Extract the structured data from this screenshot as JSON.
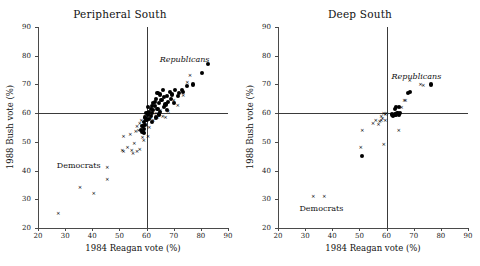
{
  "figure": {
    "background": "#ffffff",
    "marker_color": "#000000",
    "axis_color": "#4a4a4a"
  },
  "chart_data": [
    {
      "type": "scatter",
      "title": "Peripheral South",
      "xlabel": "1984 Reagan vote (%)",
      "ylabel": "1988 Bush vote (%)",
      "xlim": [
        20,
        90
      ],
      "ylim": [
        20,
        90
      ],
      "xticks": [
        20,
        30,
        40,
        50,
        60,
        70,
        80,
        90
      ],
      "yticks": [
        20,
        30,
        40,
        50,
        60,
        70,
        80,
        90
      ],
      "grid": false,
      "reference_lines": {
        "vertical_x": 60,
        "horizontal_y": 60
      },
      "legend": "none",
      "annotations": [
        {
          "text": "Republicans",
          "x": 74,
          "y": 79,
          "style": "italic"
        },
        {
          "text": "Democrats",
          "x": 35,
          "y": 42,
          "style": "normal"
        }
      ],
      "series": [
        {
          "name": "Republicans",
          "marker": "filled-circle",
          "points": [
            [
              82.5,
              77.0
            ],
            [
              80.5,
              74.0
            ],
            [
              77.0,
              70.0
            ],
            [
              75.0,
              69.5
            ],
            [
              73.5,
              67.5
            ],
            [
              73.0,
              68.0
            ],
            [
              72.0,
              67.0
            ],
            [
              71.5,
              66.0
            ],
            [
              70.5,
              68.0
            ],
            [
              69.5,
              66.5
            ],
            [
              69.0,
              65.0
            ],
            [
              68.5,
              67.5
            ],
            [
              68.0,
              64.0
            ],
            [
              67.5,
              66.0
            ],
            [
              67.0,
              63.0
            ],
            [
              66.5,
              65.5
            ],
            [
              66.0,
              68.0
            ],
            [
              65.5,
              64.5
            ],
            [
              65.0,
              66.5
            ],
            [
              64.5,
              63.5
            ],
            [
              64.0,
              67.0
            ],
            [
              64.0,
              61.5
            ],
            [
              63.5,
              65.0
            ],
            [
              63.0,
              62.5
            ],
            [
              63.0,
              64.0
            ],
            [
              62.5,
              61.0
            ],
            [
              62.5,
              63.5
            ],
            [
              62.0,
              60.0
            ],
            [
              62.0,
              62.5
            ],
            [
              61.5,
              59.0
            ],
            [
              61.5,
              61.5
            ],
            [
              61.0,
              60.5
            ],
            [
              61.0,
              58.0
            ],
            [
              60.5,
              59.5
            ],
            [
              60.5,
              62.0
            ],
            [
              60.0,
              57.5
            ],
            [
              60.0,
              60.0
            ],
            [
              59.5,
              58.5
            ],
            [
              59.5,
              56.0
            ],
            [
              59.0,
              57.0
            ],
            [
              59.0,
              54.5
            ],
            [
              58.5,
              55.5
            ],
            [
              58.5,
              53.5
            ],
            [
              58.0,
              54.0
            ],
            [
              63.5,
              58.5
            ],
            [
              65.0,
              60.5
            ],
            [
              66.5,
              62.0
            ],
            [
              67.5,
              61.0
            ],
            [
              70.0,
              63.5
            ],
            [
              59.0,
              53.0
            ],
            [
              62.0,
              57.0
            ],
            [
              64.5,
              59.5
            ]
          ]
        },
        {
          "name": "Democrats",
          "marker": "x",
          "points": [
            [
              27.5,
              25.0
            ],
            [
              35.5,
              34.0
            ],
            [
              40.5,
              32.0
            ],
            [
              45.5,
              41.0
            ],
            [
              45.5,
              37.0
            ],
            [
              51.5,
              52.0
            ],
            [
              51.0,
              47.0
            ],
            [
              51.5,
              46.5
            ],
            [
              53.0,
              48.0
            ],
            [
              54.5,
              47.0
            ],
            [
              55.0,
              46.0
            ],
            [
              55.5,
              49.5
            ],
            [
              56.0,
              53.5
            ],
            [
              56.5,
              55.5
            ],
            [
              57.0,
              54.0
            ],
            [
              57.5,
              56.5
            ],
            [
              58.0,
              57.5
            ],
            [
              58.5,
              55.0
            ],
            [
              58.5,
              51.5
            ],
            [
              59.0,
              50.5
            ],
            [
              59.5,
              59.0
            ],
            [
              59.5,
              56.0
            ],
            [
              60.0,
              58.0
            ],
            [
              60.5,
              52.0
            ],
            [
              61.0,
              55.0
            ],
            [
              62.5,
              57.5
            ],
            [
              63.5,
              60.0
            ],
            [
              64.0,
              58.5
            ],
            [
              65.0,
              61.0
            ],
            [
              66.0,
              59.0
            ],
            [
              67.0,
              58.5
            ],
            [
              68.0,
              60.5
            ],
            [
              70.0,
              64.5
            ],
            [
              71.5,
              62.5
            ],
            [
              73.5,
              66.0
            ],
            [
              75.0,
              70.5
            ],
            [
              76.0,
              73.0
            ],
            [
              56.5,
              46.5
            ],
            [
              57.5,
              47.5
            ],
            [
              59.0,
              53.5
            ],
            [
              61.5,
              58.0
            ],
            [
              54.0,
              52.5
            ]
          ]
        }
      ]
    },
    {
      "type": "scatter",
      "title": "Deep South",
      "xlabel": "1984 Reagan vote (%)",
      "ylabel": "1988 Bush vote (%)",
      "xlim": [
        20,
        90
      ],
      "ylim": [
        20,
        90
      ],
      "xticks": [
        20,
        30,
        40,
        50,
        60,
        70,
        80,
        90
      ],
      "yticks": [
        20,
        30,
        40,
        50,
        60,
        70,
        80,
        90
      ],
      "grid": false,
      "reference_lines": {
        "vertical_x": 60,
        "horizontal_y": 60
      },
      "legend": "none",
      "annotations": [
        {
          "text": "Republicans",
          "x": 71,
          "y": 73,
          "style": "italic"
        },
        {
          "text": "Democrats",
          "x": 36,
          "y": 27,
          "style": "normal"
        }
      ],
      "series": [
        {
          "name": "Republicans",
          "marker": "filled-circle",
          "points": [
            [
              76.5,
              70.0
            ],
            [
              68.5,
              67.5
            ],
            [
              68.0,
              67.0
            ],
            [
              64.5,
              62.0
            ],
            [
              63.5,
              62.0
            ],
            [
              63.0,
              61.5
            ],
            [
              63.0,
              59.5
            ],
            [
              63.5,
              59.5
            ],
            [
              64.0,
              60.0
            ],
            [
              64.5,
              59.5
            ],
            [
              62.5,
              59.0
            ],
            [
              62.0,
              59.5
            ],
            [
              65.0,
              60.0
            ],
            [
              51.0,
              45.0
            ]
          ]
        },
        {
          "name": "Democrats",
          "marker": "x",
          "points": [
            [
              33.0,
              31.0
            ],
            [
              37.0,
              31.0
            ],
            [
              50.5,
              48.0
            ],
            [
              51.0,
              54.0
            ],
            [
              55.0,
              56.5
            ],
            [
              56.0,
              57.5
            ],
            [
              57.0,
              56.0
            ],
            [
              57.5,
              57.0
            ],
            [
              58.0,
              57.5
            ],
            [
              58.5,
              58.0
            ],
            [
              59.0,
              60.0
            ],
            [
              59.5,
              59.5
            ],
            [
              59.0,
              49.0
            ],
            [
              60.0,
              60.0
            ],
            [
              64.5,
              54.0
            ],
            [
              65.5,
              62.0
            ],
            [
              66.5,
              64.5
            ],
            [
              67.0,
              64.5
            ],
            [
              68.5,
              71.5
            ],
            [
              72.5,
              70.0
            ],
            [
              73.5,
              69.5
            ],
            [
              59.5,
              57.5
            ],
            [
              58.0,
              59.0
            ]
          ]
        }
      ]
    }
  ]
}
